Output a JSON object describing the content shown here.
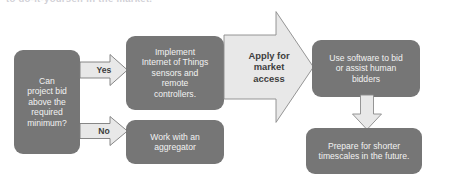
{
  "heading": {
    "text": "to do-it-yourself in the market."
  },
  "colors": {
    "node_fill": "#767676",
    "node_text": "#f2f2f2",
    "arrow_fill": "#e8e8e8",
    "arrow_stroke": "#7a7a7a",
    "arrow_text": "#3d3d3d",
    "background": "#ffffff"
  },
  "diagram": {
    "type": "flowchart",
    "nodes": [
      {
        "id": "decision",
        "name": "decision-can-project-bid",
        "label": "Can\nproject bid\nabove the\nrequired\nminimum?",
        "shape": "rounded-rectangle"
      },
      {
        "id": "iot",
        "name": "step-implement-iot",
        "label": "Implement\nInternet of Things\nsensors and\nremote\ncontrollers.",
        "shape": "rounded-rectangle"
      },
      {
        "id": "aggregator",
        "name": "step-work-with-aggregator",
        "label": "Work with an\naggregator",
        "shape": "rounded-rectangle"
      },
      {
        "id": "software",
        "name": "step-use-software-to-bid",
        "label": "Use software to bid\nor assist human\nbidders",
        "shape": "rounded-rectangle"
      },
      {
        "id": "prepare",
        "name": "step-prepare-shorter-timescales",
        "label": "Prepare for shorter\ntimescales in the future.",
        "shape": "rounded-rectangle"
      }
    ],
    "connectors": [
      {
        "id": "yes",
        "name": "arrow-yes",
        "label": "Yes",
        "from": "decision",
        "to": "iot",
        "direction": "right"
      },
      {
        "id": "no",
        "name": "arrow-no",
        "label": "No",
        "from": "decision",
        "to": "aggregator",
        "direction": "right"
      },
      {
        "id": "apply",
        "name": "arrow-apply-for-market-access",
        "label": "Apply for\nmarket\naccess",
        "from": "iot",
        "to": "software",
        "direction": "right"
      },
      {
        "id": "down",
        "name": "arrow-down",
        "label": "",
        "from": "software",
        "to": "prepare",
        "direction": "down"
      }
    ]
  }
}
